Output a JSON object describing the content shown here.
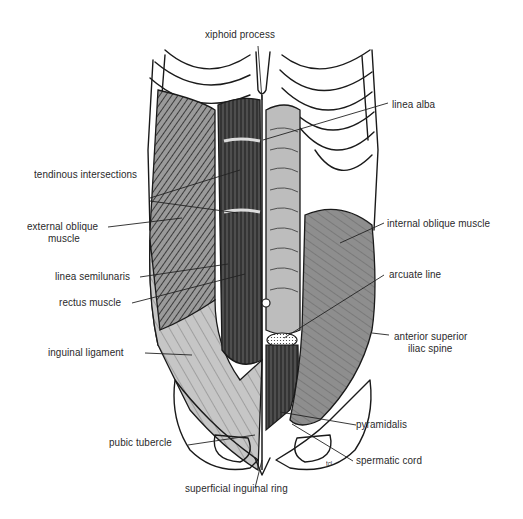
{
  "figure": {
    "colors": {
      "background": "#ffffff",
      "line": "#1a1a1a",
      "external_oblique": "#8c8c8c",
      "external_oblique_aponeurosis": "#c9c9c9",
      "rectus": "#5a5a5a",
      "rectus_sheath": "#bdbdbd",
      "internal_oblique": "#8f8f8f",
      "bone": "#ffffff",
      "label_text": "#2a2a2a"
    },
    "signature": "tcl"
  },
  "labels": {
    "xiphoid_process": "xiphoid process",
    "linea_alba": "linea alba",
    "tendinous_intersections": "tendinous intersections",
    "external_oblique_line1": "external oblique",
    "external_oblique_line2": "muscle",
    "internal_oblique": "internal oblique muscle",
    "linea_semilunaris": "linea semilunaris",
    "arcuate_line": "arcuate line",
    "rectus_muscle": "rectus muscle",
    "asis_line1": "anterior superior",
    "asis_line2": "iliac spine",
    "inguinal_ligament": "inguinal ligament",
    "pyramidalis": "pyramidalis",
    "pubic_tubercle": "pubic tubercle",
    "spermatic_cord": "spermatic cord",
    "superficial_inguinal_ring": "superficial inguinal ring"
  }
}
